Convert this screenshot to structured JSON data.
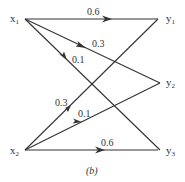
{
  "diagram": {
    "type": "channel-transition-graph",
    "caption": "(b)",
    "inputs": [
      {
        "id": "x1",
        "label": "x",
        "subscript": "1"
      },
      {
        "id": "x2",
        "label": "x",
        "subscript": "2"
      }
    ],
    "outputs": [
      {
        "id": "y1",
        "label": "y",
        "subscript": "1"
      },
      {
        "id": "y2",
        "label": "y",
        "subscript": "2"
      },
      {
        "id": "y3",
        "label": "y",
        "subscript": "3"
      }
    ],
    "edges": [
      {
        "from": "x1",
        "to": "y1",
        "weight": "0.6"
      },
      {
        "from": "x1",
        "to": "y2",
        "weight": "0.3"
      },
      {
        "from": "x1",
        "to": "y3",
        "weight": "0.1"
      },
      {
        "from": "x2",
        "to": "y1",
        "weight": "0.3"
      },
      {
        "from": "x2",
        "to": "y2",
        "weight": "0.1"
      },
      {
        "from": "x2",
        "to": "y3",
        "weight": "0.6"
      }
    ]
  }
}
